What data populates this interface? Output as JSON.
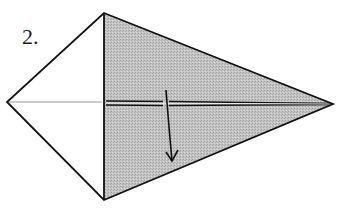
{
  "diagram": {
    "type": "origami-fold-step",
    "step_label": "2.",
    "colors": {
      "background": "#ffffff",
      "outline": "#111111",
      "shaded_face": "#b8b8b8",
      "crease_line": "#9a9a9a"
    },
    "shape": {
      "vertices": {
        "top": [
          104,
          13
        ],
        "left": [
          7,
          102
        ],
        "right": [
          333,
          104
        ],
        "bottom": [
          104,
          200
        ]
      },
      "shaded_region": "right kite half (top-right-bottom)",
      "unshaded_region": "left kite half (top-left-bottom)"
    },
    "lines": [
      {
        "name": "vertical-fold-edge",
        "from": [
          104,
          13
        ],
        "to": [
          104,
          200
        ],
        "style": "solid"
      },
      {
        "name": "center-crease-left",
        "from": [
          7,
          102
        ],
        "to": [
          104,
          102
        ],
        "style": "thin-gray"
      },
      {
        "name": "center-edge-right",
        "from": [
          104,
          102
        ],
        "to": [
          333,
          104
        ],
        "style": "double-thick"
      }
    ],
    "arrow": {
      "meaning": "fold down",
      "path_start": [
        166,
        92
      ],
      "path_end": [
        172,
        162
      ],
      "direction": "down"
    }
  }
}
